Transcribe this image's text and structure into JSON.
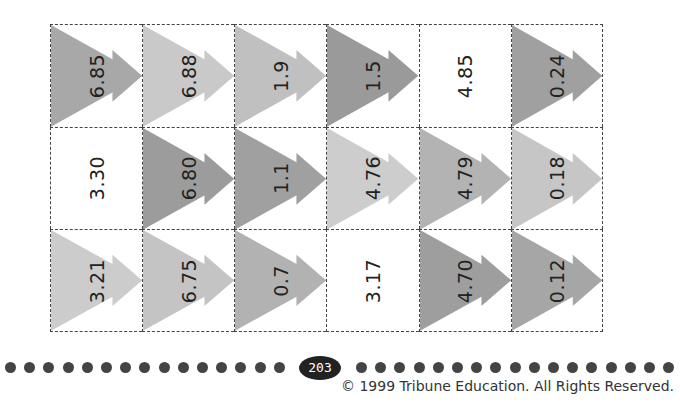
{
  "worksheet": {
    "cells": [
      [
        {
          "value": "6.85",
          "shade": "#a8a8a8"
        },
        {
          "value": "6.88",
          "shade": "#c9c9c9"
        },
        {
          "value": "1.9",
          "shade": "#c0c0c0"
        },
        {
          "value": "1.5",
          "shade": "#9a9a9a"
        },
        {
          "value": "4.85",
          "shade": null
        },
        {
          "value": "0.24",
          "shade": "#a0a0a0"
        }
      ],
      [
        {
          "value": "3.30",
          "shade": null
        },
        {
          "value": "6.80",
          "shade": "#9c9c9c"
        },
        {
          "value": "1.1",
          "shade": "#a0a0a0"
        },
        {
          "value": "4.76",
          "shade": "#cdcdcd"
        },
        {
          "value": "4.79",
          "shade": "#b3b3b3"
        },
        {
          "value": "0.18",
          "shade": "#c6c6c6"
        }
      ],
      [
        {
          "value": "3.21",
          "shade": "#cccccc"
        },
        {
          "value": "6.75",
          "shade": "#c4c4c4"
        },
        {
          "value": "0.7",
          "shade": "#b2b2b2"
        },
        {
          "value": "3.17",
          "shade": null
        },
        {
          "value": "4.70",
          "shade": "#9e9e9e"
        },
        {
          "value": "0.12",
          "shade": "#a6a6a6"
        }
      ]
    ]
  },
  "footer": {
    "page_number": "203",
    "copyright": "© 1999 Tribune Education. All Rights Reserved."
  }
}
